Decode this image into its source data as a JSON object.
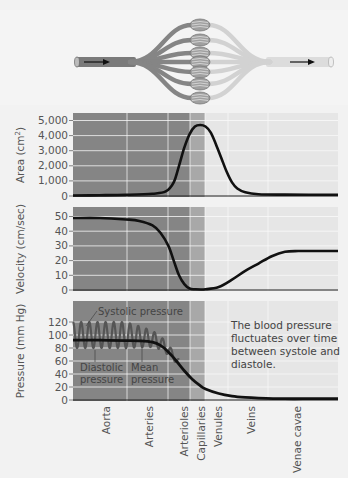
{
  "diagram": {
    "flow_direction": "left-to-right",
    "capillary_beds": 7,
    "icons": [
      "arrow-right-icon",
      "arrow-right-icon"
    ]
  },
  "colors": {
    "arterial_band": "#858585",
    "capillary_band": "#a8a8a8",
    "venous_band": "#e6e6e6",
    "curve": "#111111"
  },
  "x_categories": [
    "Aorta",
    "Arteries",
    "Arterioles",
    "Capillaries",
    "Venules",
    "Veins",
    "Venae cavae"
  ],
  "chart_data": [
    {
      "type": "line",
      "title": "Total cross-sectional area",
      "ylabel": "Area (cm²)",
      "ylabel_main": "Area (cm",
      "ylabel_sup": "2",
      "ylabel_close": ")",
      "ylim": [
        0,
        5000
      ],
      "yticks": [
        0,
        1000,
        2000,
        3000,
        4000,
        5000
      ],
      "ytick_labels": [
        "0",
        "1,000",
        "2,000",
        "3,000",
        "4,000",
        "5,000"
      ],
      "x": [
        0,
        0.1,
        0.2,
        0.3,
        0.35,
        0.38,
        0.4,
        0.42,
        0.44,
        0.46,
        0.48,
        0.5,
        0.52,
        0.54,
        0.56,
        0.58,
        0.6,
        0.62,
        0.65,
        0.7,
        0.8,
        0.9,
        1.0
      ],
      "values": [
        30,
        50,
        80,
        150,
        300,
        900,
        2000,
        3200,
        4100,
        4600,
        4700,
        4600,
        4200,
        3400,
        2500,
        1600,
        900,
        500,
        250,
        120,
        90,
        80,
        80
      ]
    },
    {
      "type": "line",
      "title": "Velocity",
      "ylabel": "Velocity (cm/sec)",
      "ylim": [
        0,
        50
      ],
      "yticks": [
        0,
        10,
        20,
        30,
        40,
        50
      ],
      "ytick_labels": [
        "0",
        "10",
        "20",
        "30",
        "40",
        "50"
      ],
      "x": [
        0,
        0.1,
        0.2,
        0.25,
        0.3,
        0.33,
        0.36,
        0.38,
        0.4,
        0.42,
        0.44,
        0.46,
        0.5,
        0.55,
        0.6,
        0.65,
        0.7,
        0.75,
        0.8,
        0.85,
        0.9,
        1.0
      ],
      "values": [
        49,
        49,
        48,
        47,
        44,
        39,
        30,
        20,
        10,
        4,
        1,
        0.5,
        0.5,
        2,
        7,
        13,
        18,
        23,
        26,
        26.5,
        26.5,
        26.5
      ]
    },
    {
      "type": "line",
      "title": "Blood pressure",
      "ylabel": "Pressure (mm Hg)",
      "ylim": [
        0,
        120
      ],
      "yticks": [
        0,
        20,
        40,
        60,
        80,
        100,
        120
      ],
      "ytick_labels": [
        "0",
        "20",
        "40",
        "60",
        "80",
        "100",
        "120"
      ],
      "mean_x": [
        0,
        0.1,
        0.2,
        0.25,
        0.3,
        0.33,
        0.36,
        0.39,
        0.42,
        0.45,
        0.48,
        0.5,
        0.55,
        0.6,
        0.65,
        0.7,
        0.8,
        0.9,
        1.0
      ],
      "mean_values": [
        92,
        92,
        91.5,
        91,
        89,
        84,
        74,
        60,
        45,
        32,
        22,
        17,
        10,
        6,
        4,
        3,
        2,
        2,
        2
      ],
      "oscillation": {
        "cycles": 13,
        "x_end": 0.4,
        "systolic_start": 120,
        "diastolic_start": 80
      },
      "annotations": {
        "systolic": "Systolic pressure",
        "diastolic_1": "Diastolic",
        "diastolic_2": "pressure",
        "mean_1": "Mean",
        "mean_2": "pressure",
        "note": [
          "The blood pressure",
          "fluctuates over time",
          "between systole and",
          "diastole."
        ]
      }
    }
  ]
}
